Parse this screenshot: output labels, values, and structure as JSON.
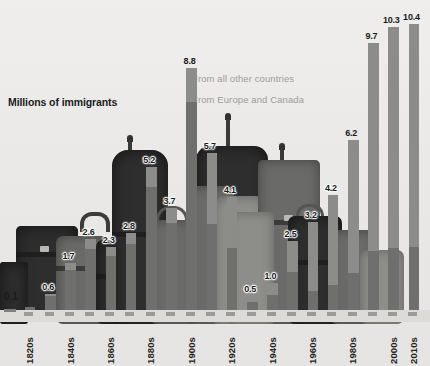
{
  "chart_data": {
    "type": "bar",
    "title": "",
    "ylabel": "Millions of immigrants",
    "xlabel": "",
    "grid": false,
    "ylim": [
      0,
      10.4
    ],
    "legend_position": "inside-top-right",
    "categories": [
      "1820s",
      "1830s",
      "1840s",
      "1850s",
      "1860s",
      "1870s",
      "1880s",
      "1890s",
      "1900s",
      "1910s",
      "1920s",
      "1930s",
      "1940s",
      "1950s",
      "1960s",
      "1970s",
      "1980s",
      "1990s",
      "2000s",
      "2010s"
    ],
    "values": [
      0.1,
      0.6,
      1.7,
      2.6,
      2.3,
      2.8,
      5.2,
      3.7,
      8.8,
      5.7,
      4.1,
      0.5,
      1.0,
      2.5,
      3.2,
      4.2,
      6.2,
      9.7,
      10.3,
      10.4
    ],
    "labeled_ticks": [
      "1820s",
      "1840s",
      "1860s",
      "1880s",
      "1900s",
      "1920s",
      "1940s",
      "1960s",
      "1980s",
      "2000s",
      "2010s"
    ],
    "series": [
      {
        "name": "From all other countries",
        "color": "#8c8c8a"
      },
      {
        "name": "From Europe and Canada",
        "color": "#6f6f6d"
      }
    ]
  },
  "chart": {
    "y_axis_title": "Millions of immigrants",
    "zero_label": "0.1",
    "legend": [
      {
        "label": "From all other countries"
      },
      {
        "label": "From Europe and Canada"
      }
    ],
    "bars": [
      {
        "decade": "1820s",
        "value": "0.1",
        "show_label": false
      },
      {
        "decade": "1830s",
        "value": "0.6",
        "show_label": true
      },
      {
        "decade": "1840s",
        "value": "1.7",
        "show_label": true
      },
      {
        "decade": "1850s",
        "value": "2.6",
        "show_label": true
      },
      {
        "decade": "1860s",
        "value": "2.3",
        "show_label": true
      },
      {
        "decade": "1870s",
        "value": "2.8",
        "show_label": true
      },
      {
        "decade": "1880s",
        "value": "5.2",
        "show_label": true
      },
      {
        "decade": "1890s",
        "value": "3.7",
        "show_label": true
      },
      {
        "decade": "1900s",
        "value": "8.8",
        "show_label": true
      },
      {
        "decade": "1910s",
        "value": "5.7",
        "show_label": true
      },
      {
        "decade": "1920s",
        "value": "4.1",
        "show_label": true
      },
      {
        "decade": "1930s",
        "value": "0.5",
        "show_label": true
      },
      {
        "decade": "1940s",
        "value": "1.0",
        "show_label": true
      },
      {
        "decade": "1950s",
        "value": "2.5",
        "show_label": true
      },
      {
        "decade": "1960s",
        "value": "3.2",
        "show_label": true
      },
      {
        "decade": "1970s",
        "value": "4.2",
        "show_label": true
      },
      {
        "decade": "1980s",
        "value": "6.2",
        "show_label": true
      },
      {
        "decade": "1990s",
        "value": "9.7",
        "show_label": true
      },
      {
        "decade": "2000s",
        "value": "10.3",
        "show_label": true
      },
      {
        "decade": "2010s",
        "value": "10.4",
        "show_label": true
      }
    ],
    "x_labels": [
      "1820s",
      "1840s",
      "1860s",
      "1880s",
      "1900s",
      "1920s",
      "1940s",
      "1960s",
      "1980s",
      "2000s",
      "2010s"
    ],
    "colors": {
      "bar_other": "#8c8c8a",
      "bar_europe": "#6f6f6d",
      "text": "#1b1b1b",
      "legend_text": "#9c9c9a",
      "background": "#e8e8e6"
    }
  }
}
